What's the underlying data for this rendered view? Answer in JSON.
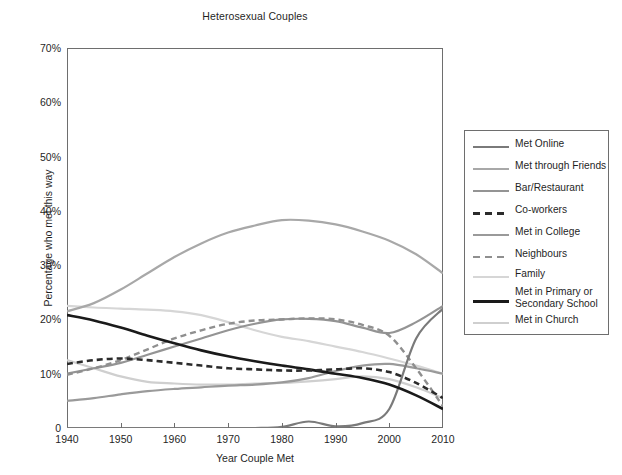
{
  "chart_data": {
    "type": "line",
    "title": "Heterosexual Couples",
    "xlabel": "Year Couple Met",
    "ylabel": "Percentage who met this way",
    "xlim": [
      1940,
      2010
    ],
    "ylim": [
      0,
      70
    ],
    "grid": false,
    "legend_position": "right",
    "xticks": [
      1940,
      1950,
      1960,
      1970,
      1980,
      1990,
      2000,
      2010
    ],
    "xtick_labels": [
      "1940",
      "1950",
      "1960",
      "1970",
      "1980",
      "1990",
      "2000",
      "2010"
    ],
    "yticks": [
      0,
      10,
      20,
      30,
      40,
      50,
      60,
      70
    ],
    "ytick_labels": [
      "0",
      "10%",
      "20%",
      "30%",
      "40%",
      "50%",
      "60%",
      "70%"
    ],
    "x": [
      1940,
      1945,
      1950,
      1955,
      1960,
      1965,
      1970,
      1975,
      1980,
      1985,
      1990,
      1995,
      2000,
      2005,
      2010
    ],
    "series": [
      {
        "name": "Met Online",
        "color": "#7a7a7a",
        "dash": "solid",
        "width": 2.2,
        "values": [
          0,
          0,
          0,
          0,
          0,
          0,
          0,
          0,
          0.2,
          1.2,
          0.3,
          0.9,
          3.5,
          16.5,
          22.0
        ]
      },
      {
        "name": "Met through Friends",
        "color": "#a8a8a8",
        "dash": "solid",
        "width": 2.2,
        "values": [
          21.5,
          23.0,
          25.5,
          28.5,
          31.5,
          34.0,
          36.0,
          37.3,
          38.3,
          38.2,
          37.5,
          36.2,
          34.5,
          32.0,
          28.5
        ]
      },
      {
        "name": "Bar/Restaurant",
        "color": "#949494",
        "dash": "solid",
        "width": 2.2,
        "values": [
          10.0,
          11.0,
          12.0,
          13.5,
          15.0,
          16.5,
          18.0,
          19.2,
          20.0,
          20.1,
          19.7,
          18.5,
          17.5,
          19.5,
          22.5
        ]
      },
      {
        "name": "Co-workers",
        "color": "#2b2b2b",
        "dash": "dashed",
        "width": 2.6,
        "values": [
          11.8,
          12.5,
          12.8,
          12.5,
          12.0,
          11.5,
          11.0,
          10.8,
          10.6,
          10.6,
          10.8,
          11.0,
          10.3,
          8.3,
          5.5
        ]
      },
      {
        "name": "Met in College",
        "color": "#9a9a9a",
        "dash": "solid",
        "width": 2.2,
        "values": [
          5.0,
          5.5,
          6.2,
          6.8,
          7.2,
          7.5,
          7.8,
          8.0,
          8.4,
          9.2,
          10.5,
          11.5,
          11.8,
          11.0,
          10.0
        ]
      },
      {
        "name": "Neighbours",
        "color": "#8f8f8f",
        "dash": "dashed",
        "width": 2.4,
        "values": [
          9.8,
          11.0,
          12.5,
          14.5,
          16.5,
          18.0,
          19.2,
          19.8,
          20.0,
          20.2,
          20.0,
          19.0,
          17.0,
          11.0,
          4.0
        ]
      },
      {
        "name": "Family",
        "color": "#d6d6d6",
        "dash": "solid",
        "width": 2.2,
        "values": [
          22.5,
          22.2,
          22.0,
          21.8,
          21.5,
          20.8,
          19.5,
          18.0,
          16.8,
          16.0,
          15.0,
          14.0,
          12.8,
          11.5,
          10.0
        ]
      },
      {
        "name": "Met in Primary or Secondary School",
        "color": "#1a1a1a",
        "dash": "solid",
        "width": 2.6,
        "values": [
          20.8,
          19.8,
          18.5,
          17.0,
          15.6,
          14.3,
          13.2,
          12.3,
          11.5,
          10.8,
          10.0,
          9.2,
          8.0,
          6.0,
          3.5
        ]
      },
      {
        "name": "Met in Church",
        "color": "#cfcfcf",
        "dash": "solid",
        "width": 2.2,
        "values": [
          12.5,
          11.0,
          9.5,
          8.5,
          8.2,
          8.0,
          8.0,
          8.2,
          8.3,
          8.6,
          9.0,
          9.5,
          9.0,
          7.5,
          5.5
        ]
      }
    ]
  },
  "legend": {
    "entries": [
      {
        "label": "Met Online"
      },
      {
        "label": "Met through Friends"
      },
      {
        "label": "Bar/Restaurant"
      },
      {
        "label": "Co-workers"
      },
      {
        "label": "Met in College"
      },
      {
        "label": "Neighbours"
      },
      {
        "label": "Family"
      },
      {
        "label": "Met in Primary or\nSecondary School"
      },
      {
        "label": "Met in Church"
      }
    ]
  }
}
